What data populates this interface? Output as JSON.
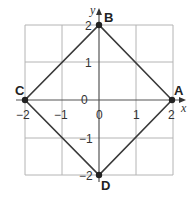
{
  "diagram": {
    "type": "coordinate-plane",
    "axes": {
      "x_label": "x",
      "y_label": "y",
      "x_range": [
        -2,
        2
      ],
      "y_range": [
        -2,
        2
      ]
    },
    "x_ticks": [
      "−2",
      "−1",
      "0",
      "1",
      "2"
    ],
    "y_ticks": [
      "2",
      "1",
      "0",
      "−1",
      "−2"
    ],
    "points": [
      {
        "name": "A",
        "x": 2,
        "y": 0
      },
      {
        "name": "B",
        "x": 0,
        "y": 2
      },
      {
        "name": "C",
        "x": -2,
        "y": 0
      },
      {
        "name": "D",
        "x": 0,
        "y": -2
      }
    ],
    "shape": "square ABDC (rotated 45°)",
    "colors": {
      "grid": "#b4b4b4",
      "lines": "#3a3a3a",
      "points": "#222222"
    }
  }
}
